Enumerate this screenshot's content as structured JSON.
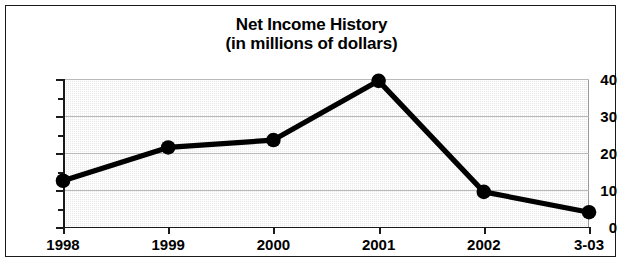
{
  "chart_data": {
    "type": "line",
    "title": "Net Income History",
    "subtitle": "(in millions of dollars)",
    "xlabel": "",
    "ylabel": "",
    "categories": [
      "1998",
      "1999",
      "2000",
      "2001",
      "2002",
      "3-03"
    ],
    "values": [
      12.5,
      21.5,
      23.5,
      39.5,
      9.5,
      4
    ],
    "series": [
      {
        "name": "Net Income",
        "values": [
          12.5,
          21.5,
          23.5,
          39.5,
          9.5,
          4
        ]
      }
    ],
    "ylim": [
      0,
      40
    ],
    "yticks": [
      0,
      10,
      20,
      30,
      40
    ],
    "ytick_labels": [
      "0",
      "10",
      "20",
      "30",
      "40"
    ],
    "yminor_ticks": [
      5,
      15,
      25,
      35
    ],
    "grid": true,
    "grid_axis": "y",
    "legend": false,
    "legend_position": "none",
    "marker": "circle",
    "line_color": "#000000",
    "marker_color": "#000000",
    "plot_background": "#e9e9e9",
    "gridline_color": "#b9b9b9",
    "frame_color": "#1a1a1a"
  },
  "figure": {
    "title_line_1": "Net Income History",
    "title_line_2": "(in millions of dollars)"
  }
}
